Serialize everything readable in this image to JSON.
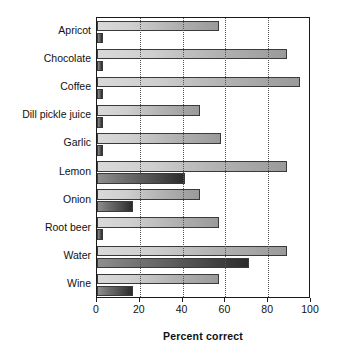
{
  "chart_data": {
    "type": "bar",
    "orientation": "horizontal",
    "title": "",
    "xlabel": "Percent correct",
    "ylabel": "",
    "xlim": [
      0,
      100
    ],
    "ylim": null,
    "grid": "vertical-dotted",
    "legend": "none",
    "xticks": [
      0,
      20,
      40,
      60,
      80,
      100
    ],
    "xticklabels": [
      "0",
      "20",
      "40",
      "60",
      "80",
      "100"
    ],
    "categories": [
      "Apricot",
      "Chocolate",
      "Coffee",
      "Dill pickle juice",
      "Garlic",
      "Lemon",
      "Onion",
      "Root beer",
      "Water",
      "Wine"
    ],
    "series": [
      {
        "name": "light-bar",
        "color": "#c4c4c4",
        "values": [
          57,
          89,
          95,
          48,
          58,
          89,
          48,
          57,
          89,
          57
        ]
      },
      {
        "name": "dark-bar",
        "color": "#4a4a4a",
        "values": [
          3,
          3,
          3,
          3,
          3,
          41,
          17,
          3,
          71,
          17
        ]
      }
    ]
  },
  "axis": {
    "x_title": "Percent correct"
  }
}
